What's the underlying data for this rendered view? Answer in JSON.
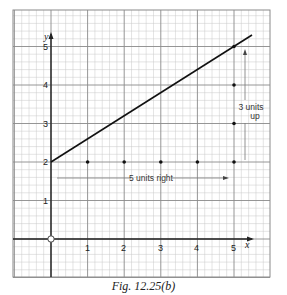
{
  "caption": "Fig. 12.25(b)",
  "colors": {
    "minor_grid": "#c8c8c8",
    "major_grid": "#8a8a8a",
    "axis": "#222222",
    "line": "#111111",
    "arrow": "#555555",
    "text": "#222222"
  },
  "axes": {
    "x_label": "x",
    "y_label": "y",
    "x_ticks": [
      "1",
      "2",
      "3",
      "4",
      "5"
    ],
    "y_ticks": [
      "1",
      "2",
      "3",
      "4",
      "5"
    ],
    "origin_label": "O"
  },
  "annotations": {
    "horizontal_arrow": "5 units right",
    "vertical_arrow_line1": "3 units",
    "vertical_arrow_line2": "up"
  },
  "chart_data": {
    "type": "line",
    "title": "Fig. 12.25(b)",
    "xlabel": "x",
    "ylabel": "y",
    "xlim": [
      -1,
      6
    ],
    "ylim": [
      -0.8,
      6
    ],
    "grid": true,
    "x_ticks": [
      1,
      2,
      3,
      4,
      5
    ],
    "y_ticks": [
      1,
      2,
      3,
      4,
      5
    ],
    "series": [
      {
        "name": "line",
        "kind": "line",
        "x": [
          0,
          5.5
        ],
        "y": [
          2,
          5.3
        ]
      },
      {
        "name": "horizontal steps",
        "kind": "scatter",
        "x": [
          1,
          2,
          3,
          4,
          5
        ],
        "y": [
          2,
          2,
          2,
          2,
          2
        ]
      },
      {
        "name": "vertical steps",
        "kind": "scatter",
        "x": [
          5,
          5,
          5
        ],
        "y": [
          3,
          4,
          5
        ]
      }
    ],
    "annotations": [
      {
        "text": "5 units right",
        "type": "arrow",
        "from": [
          0.2,
          1.6
        ],
        "to": [
          4.8,
          1.6
        ]
      },
      {
        "text": "3 units up",
        "type": "arrow",
        "from": [
          5.3,
          2
        ],
        "to": [
          5.3,
          4.9
        ]
      }
    ],
    "points_marked": [
      [
        0,
        2
      ],
      [
        1,
        2
      ],
      [
        2,
        2
      ],
      [
        3,
        2
      ],
      [
        4,
        2
      ],
      [
        5,
        2
      ],
      [
        5,
        3
      ],
      [
        5,
        4
      ],
      [
        5,
        5
      ]
    ],
    "origin": [
      0,
      0
    ]
  }
}
